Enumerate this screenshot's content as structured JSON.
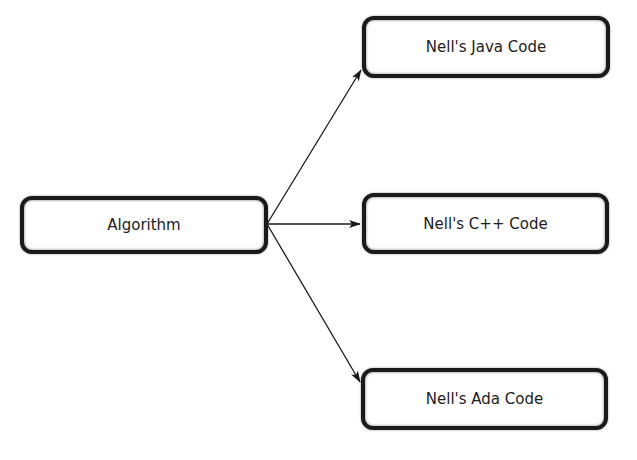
{
  "diagram": {
    "source": {
      "label": "Algorithm"
    },
    "targets": [
      {
        "label": "Nell's Java Code"
      },
      {
        "label": "Nell's C++ Code"
      },
      {
        "label": "Nell's Ada Code"
      }
    ],
    "edges": [
      {
        "from": "Algorithm",
        "to": "Nell's Java Code"
      },
      {
        "from": "Algorithm",
        "to": "Nell's C++ Code"
      },
      {
        "from": "Algorithm",
        "to": "Nell's Ada Code"
      }
    ],
    "colors": {
      "stroke": "#1a1a1a",
      "background": "#ffffff"
    }
  }
}
